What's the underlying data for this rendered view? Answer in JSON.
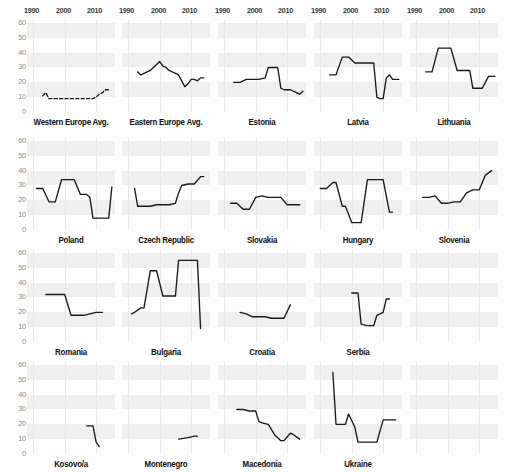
{
  "figure": {
    "caption_fragment": "",
    "xticks": [
      1990,
      2000,
      2010
    ],
    "yticks": [
      0,
      10,
      20,
      30,
      40,
      50,
      60
    ],
    "x_range": [
      1988,
      2016
    ],
    "y_range": [
      0,
      62
    ]
  },
  "chart_data": {
    "type": "line",
    "title": "",
    "xlabel": "",
    "ylabel": "",
    "xlim": [
      1988,
      2016
    ],
    "ylim": [
      0,
      62
    ],
    "grid": true,
    "legend": "none",
    "layout": {
      "rows": 4,
      "cols": 5
    },
    "shared_xticks": [
      1990,
      2000,
      2010
    ],
    "shared_yticks": [
      0,
      10,
      20,
      30,
      40,
      50,
      60
    ],
    "panels": [
      {
        "name": "Western Europe Avg.",
        "row": 1,
        "col": 1,
        "style": "dashed",
        "x": [
          1993,
          1994,
          1995,
          1996,
          1997,
          1998,
          1999,
          2000,
          2001,
          2002,
          2003,
          2004,
          2005,
          2006,
          2007,
          2008,
          2009,
          2010,
          2011,
          2012,
          2013,
          2014
        ],
        "y": [
          11,
          13,
          9,
          9,
          9,
          9,
          9,
          9,
          9,
          9,
          9,
          9,
          9,
          9,
          9,
          9,
          9,
          10,
          12,
          13,
          15,
          15
        ]
      },
      {
        "name": "Eastern Europe Avg.",
        "row": 1,
        "col": 2,
        "style": "solid",
        "x": [
          1993,
          1994,
          1995,
          1996,
          1997,
          1998,
          1999,
          2000,
          2001,
          2002,
          2003,
          2004,
          2005,
          2006,
          2007,
          2008,
          2009,
          2010,
          2011,
          2012,
          2013,
          2014
        ],
        "y": [
          27,
          25,
          26,
          27,
          28,
          30,
          32,
          34,
          31,
          30,
          28,
          27,
          26,
          25,
          21,
          17,
          19,
          22,
          22,
          21,
          23,
          23
        ]
      },
      {
        "name": "Estonia",
        "row": 1,
        "col": 3,
        "style": "solid",
        "x": [
          1993,
          1995,
          1997,
          1999,
          2001,
          2003,
          2004,
          2005,
          2006,
          2007,
          2008,
          2009,
          2011,
          2013,
          2014,
          2015
        ],
        "y": [
          20,
          20,
          22,
          22,
          22,
          23,
          30,
          30,
          30,
          30,
          16,
          15,
          15,
          13,
          12,
          14
        ]
      },
      {
        "name": "Latvia",
        "row": 1,
        "col": 4,
        "style": "solid",
        "x": [
          1993,
          1995,
          1997,
          1999,
          2001,
          2003,
          2005,
          2007,
          2008,
          2009,
          2010,
          2011,
          2012,
          2013,
          2015
        ],
        "y": [
          25,
          25,
          37,
          37,
          33,
          33,
          33,
          33,
          10,
          9,
          9,
          23,
          25,
          22,
          22
        ]
      },
      {
        "name": "Lithuania",
        "row": 1,
        "col": 5,
        "style": "solid",
        "x": [
          1993,
          1995,
          1997,
          1999,
          2001,
          2003,
          2005,
          2007,
          2008,
          2009,
          2011,
          2013,
          2015
        ],
        "y": [
          27,
          27,
          43,
          43,
          43,
          28,
          28,
          28,
          16,
          16,
          16,
          24,
          24
        ]
      },
      {
        "name": "Poland",
        "row": 2,
        "col": 1,
        "style": "solid",
        "x": [
          1991,
          1993,
          1995,
          1996,
          1997,
          1999,
          2001,
          2003,
          2005,
          2007,
          2008,
          2009,
          2011,
          2013,
          2014,
          2015
        ],
        "y": [
          28,
          28,
          19,
          19,
          19,
          34,
          34,
          34,
          24,
          24,
          22,
          8,
          8,
          8,
          8,
          29
        ]
      },
      {
        "name": "Czech Republic",
        "row": 2,
        "col": 2,
        "style": "solid",
        "x": [
          1992,
          1993,
          1995,
          1997,
          1999,
          2001,
          2003,
          2005,
          2006,
          2007,
          2009,
          2011,
          2013,
          2014
        ],
        "y": [
          28,
          16,
          16,
          16,
          17,
          17,
          17,
          18,
          25,
          30,
          31,
          31,
          36,
          36
        ]
      },
      {
        "name": "Slovakia",
        "row": 2,
        "col": 3,
        "style": "solid",
        "x": [
          1992,
          1994,
          1996,
          1998,
          2000,
          2002,
          2004,
          2006,
          2008,
          2010,
          2012,
          2014
        ],
        "y": [
          18,
          18,
          14,
          14,
          22,
          23,
          22,
          22,
          22,
          17,
          17,
          17
        ]
      },
      {
        "name": "Hungary",
        "row": 2,
        "col": 4,
        "style": "solid",
        "x": [
          1990,
          1992,
          1994,
          1995,
          1997,
          1998,
          2000,
          2002,
          2003,
          2005,
          2006,
          2008,
          2010,
          2012,
          2013
        ],
        "y": [
          28,
          28,
          32,
          32,
          16,
          16,
          5,
          5,
          5,
          34,
          34,
          34,
          34,
          12,
          12
        ]
      },
      {
        "name": "Slovenia",
        "row": 2,
        "col": 5,
        "style": "solid",
        "x": [
          1992,
          1994,
          1996,
          1998,
          2000,
          2002,
          2004,
          2006,
          2008,
          2010,
          2012,
          2014
        ],
        "y": [
          22,
          22,
          23,
          18,
          18,
          19,
          19,
          25,
          27,
          27,
          37,
          40
        ]
      },
      {
        "name": "Romania",
        "row": 3,
        "col": 1,
        "style": "solid",
        "x": [
          1994,
          1996,
          1998,
          2000,
          2002,
          2004,
          2006,
          2008,
          2010,
          2012
        ],
        "y": [
          32,
          32,
          32,
          32,
          18,
          18,
          18,
          19,
          20,
          20
        ]
      },
      {
        "name": "Bulgaria",
        "row": 3,
        "col": 2,
        "style": "solid",
        "x": [
          1991,
          1992,
          1994,
          1995,
          1997,
          1999,
          2001,
          2003,
          2005,
          2006,
          2008,
          2010,
          2012,
          2013
        ],
        "y": [
          19,
          20,
          23,
          23,
          48,
          48,
          31,
          31,
          31,
          55,
          55,
          55,
          55,
          9
        ]
      },
      {
        "name": "Croatia",
        "row": 3,
        "col": 3,
        "style": "solid",
        "x": [
          1995,
          1997,
          1999,
          2001,
          2003,
          2005,
          2007,
          2009,
          2011
        ],
        "y": [
          20,
          19,
          17,
          17,
          17,
          16,
          16,
          16,
          25
        ]
      },
      {
        "name": "Serbia",
        "row": 3,
        "col": 4,
        "style": "solid",
        "x": [
          2000,
          2002,
          2003,
          2005,
          2007,
          2008,
          2010,
          2011,
          2012
        ],
        "y": [
          33,
          33,
          12,
          11,
          11,
          18,
          20,
          29,
          29
        ]
      },
      {
        "name": "Kosovo/a",
        "row": 4,
        "col": 1,
        "style": "solid",
        "x": [
          2007,
          2009,
          2010,
          2011
        ],
        "y": [
          19,
          19,
          8,
          5
        ]
      },
      {
        "name": "Montenegro",
        "row": 4,
        "col": 2,
        "style": "solid",
        "x": [
          2006,
          2009,
          2011,
          2012
        ],
        "y": [
          10,
          11,
          12,
          12
        ]
      },
      {
        "name": "Macedonia",
        "row": 4,
        "col": 3,
        "style": "solid",
        "x": [
          1994,
          1996,
          1998,
          2000,
          2001,
          2002,
          2004,
          2006,
          2008,
          2009,
          2011,
          2012,
          2014
        ],
        "y": [
          30,
          30,
          29,
          29,
          22,
          21,
          20,
          13,
          9,
          9,
          14,
          13,
          10
        ]
      },
      {
        "name": "Ukraine",
        "row": 4,
        "col": 4,
        "style": "solid",
        "x": [
          1994,
          1995,
          1997,
          1998,
          1999,
          2001,
          2002,
          2004,
          2006,
          2008,
          2010,
          2012,
          2014
        ],
        "y": [
          55,
          20,
          20,
          20,
          27,
          18,
          8,
          8,
          8,
          8,
          23,
          23,
          23
        ]
      }
    ]
  }
}
